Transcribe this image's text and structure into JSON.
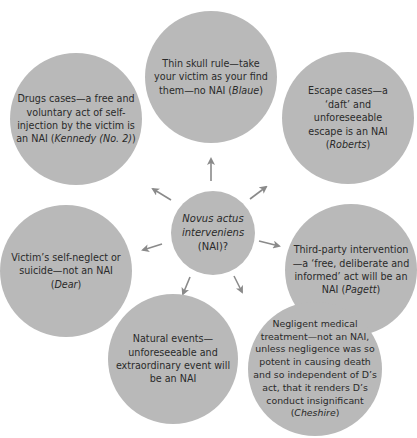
{
  "diagram": {
    "center": {
      "line1": "Novus actus",
      "line2": "interveniens",
      "line3": "(NAI)?"
    },
    "nodes": [
      {
        "id": "thin-skull",
        "text": "Thin skull rule—take your victim as your find them—no NAI (",
        "case": "Blaue",
        "suffix": ")"
      },
      {
        "id": "escape",
        "text": "Escape cases—a ‘daft’ and unforeseeable escape is an NAI (",
        "case": "Roberts",
        "suffix": ")"
      },
      {
        "id": "third-party",
        "text": "Third-party intervention—a ‘free, deliberate and informed’ act will be an NAI (",
        "case": "Pagett",
        "suffix": ")"
      },
      {
        "id": "medical",
        "text": "Negligent medical treatment—not an NAI, unless negligence was so potent in causing death and so independent of D’s act, that it renders D’s conduct insignificant (",
        "case": "Cheshire",
        "suffix": ")"
      },
      {
        "id": "natural",
        "text": "Natural events—unforeseeable and extraordinary event will be an NAI",
        "case": "",
        "suffix": ""
      },
      {
        "id": "self-neglect",
        "text": "Victim’s self-neglect or suicide—not an NAI (",
        "case": "Dear",
        "suffix": ")"
      },
      {
        "id": "drugs",
        "text": "Drugs cases—a free and voluntary act of self-injection by the victim is an NAI (",
        "case": "Kennedy (No. 2)",
        "suffix": ")"
      }
    ],
    "colors": {
      "circle_fill": "#b9b9b9",
      "arrow": "#8a8a8a",
      "text": "#2a2a2a"
    }
  }
}
